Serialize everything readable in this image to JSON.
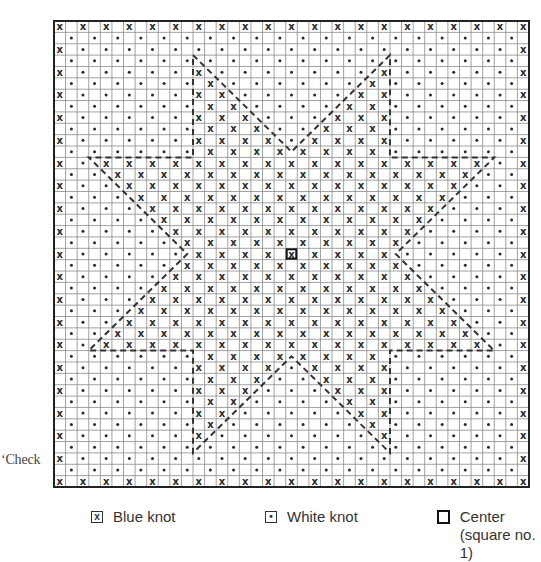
{
  "side_text": "‘Check",
  "grid": {
    "columns": 41,
    "rows": 41,
    "origin_px": [
      54,
      21
    ],
    "size_px": [
      475,
      466
    ],
    "center_cell": [
      20,
      20
    ],
    "mark_rule": "marks at cells where (row+col) is even; border cells and cells inside star = blue knot (x); others = white knot (dot)",
    "star_polygon_cells": [
      [
        12,
        3
      ],
      [
        20.5,
        11.5
      ],
      [
        29,
        3
      ],
      [
        29,
        12
      ],
      [
        38,
        12
      ],
      [
        29.5,
        20.5
      ],
      [
        38,
        29
      ],
      [
        29,
        29
      ],
      [
        29,
        38
      ],
      [
        20.5,
        29.5
      ],
      [
        12,
        38
      ],
      [
        12,
        29
      ],
      [
        3,
        29
      ],
      [
        11.5,
        20.5
      ],
      [
        3,
        12
      ],
      [
        12,
        12
      ]
    ]
  },
  "colors": {
    "grid_line": "#8a8a8a",
    "border": "#222222",
    "mark": "#2a2a2a",
    "dash": "#333333"
  },
  "legend": {
    "blue_knot": {
      "symbol": "x",
      "label": "Blue knot"
    },
    "white_knot": {
      "symbol": "•",
      "label": "White knot"
    },
    "center": {
      "label": "Center",
      "sublabel": "(square no. 1)"
    }
  },
  "chart_data": {
    "type": "heatmap",
    "title": "",
    "categories": [
      "Blue knot",
      "White knot",
      "Center"
    ],
    "legend_position": "bottom",
    "grid": true
  }
}
